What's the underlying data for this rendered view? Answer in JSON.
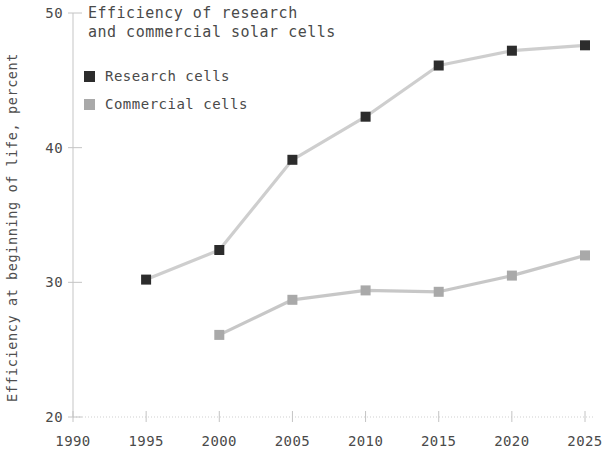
{
  "chart_data": {
    "type": "line",
    "title": "Efficiency of research\nand commercial solar cells",
    "xlabel": "",
    "ylabel": "Efficiency at beginning of life, percent",
    "x": [
      1990,
      1995,
      2000,
      2005,
      2010,
      2015,
      2020,
      2025
    ],
    "xticks": [
      "1990",
      "1995",
      "2000",
      "2005",
      "2010",
      "2015",
      "2020",
      "2025"
    ],
    "yticks": [
      "20",
      "30",
      "40",
      "50"
    ],
    "xlim": [
      1990,
      2025
    ],
    "ylim": [
      20,
      50
    ],
    "grid": false,
    "legend_position": "top-left",
    "marker": "square",
    "series": [
      {
        "name": "Research cells",
        "color": "#2c2c2c",
        "x": [
          1995,
          2000,
          2005,
          2010,
          2015,
          2020,
          2025
        ],
        "values": [
          30.2,
          32.4,
          39.1,
          42.3,
          46.1,
          47.2,
          47.6
        ]
      },
      {
        "name": "Commercial cells",
        "color": "#a9a9a9",
        "x": [
          2000,
          2005,
          2010,
          2015,
          2020,
          2025
        ],
        "values": [
          26.1,
          28.7,
          29.4,
          29.3,
          30.5,
          32.0
        ]
      }
    ]
  },
  "axis": {
    "line_color": "#cfcfcf",
    "tick_color": "#c4c4c4"
  }
}
